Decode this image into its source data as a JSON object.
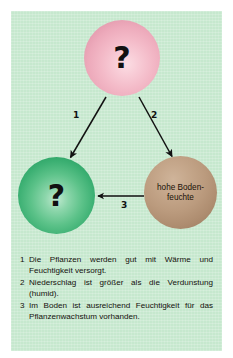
{
  "figure": {
    "background_color": "#c6e8ce",
    "page_color": "#ffffff"
  },
  "diagram": {
    "type": "concept-cycle",
    "nodes": [
      {
        "id": "top",
        "label": "?",
        "color": "#f3b9c7",
        "shape": "sphere",
        "position": "top-center"
      },
      {
        "id": "left",
        "label": "?",
        "color": "#3cb073",
        "shape": "sphere",
        "position": "bottom-left"
      },
      {
        "id": "right",
        "label": "hohe Boden-\nfeuchte",
        "label_line1": "hohe Boden-",
        "label_line2": "feuchte",
        "color": "#bb9b7e",
        "shape": "sphere",
        "position": "bottom-right"
      }
    ],
    "arrows": [
      {
        "id": "a1",
        "number": "1",
        "from": "top",
        "to": "left"
      },
      {
        "id": "a2",
        "number": "2",
        "from": "top",
        "to": "right"
      },
      {
        "id": "a3",
        "number": "3",
        "from": "right",
        "to": "left"
      }
    ],
    "arrow_color": "#111111"
  },
  "caption": {
    "items": [
      {
        "number": "1",
        "text": "Die Pflanzen werden gut mit Wärme und Feuchtigkeit versorgt."
      },
      {
        "number": "2",
        "text": "Niederschlag ist größer als die Verdunstung (humid)."
      },
      {
        "number": "3",
        "text": "Im Boden ist ausreichend Feuchtigkeit für das Pflanzenwachstum vorhanden."
      }
    ]
  }
}
